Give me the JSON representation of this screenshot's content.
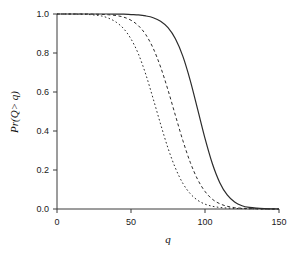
{
  "chart_data": {
    "type": "line",
    "title": "",
    "subtitle": "",
    "xlabel": "q",
    "ylabel": "Pr(Q> q)",
    "xlim": [
      0,
      150
    ],
    "ylim": [
      0.0,
      1.0
    ],
    "grid": false,
    "legend": "none",
    "xticks": [
      0,
      50,
      100,
      150
    ],
    "xtick_labels": [
      "0",
      "50",
      "100",
      "150"
    ],
    "yticks": [
      0.0,
      0.2,
      0.4,
      0.6,
      0.8,
      1.0
    ],
    "ytick_labels": [
      "0.0",
      "0.2",
      "0.4",
      "0.6",
      "0.8",
      "1.0"
    ],
    "background_color": "#ffffff",
    "axis_color": "#3b3b3b",
    "curve_color": "#2b2b2b",
    "series": [
      {
        "name": "curve-1-dotted",
        "style": "dotted",
        "dasharray": "1.6 2.4",
        "linewidth": 1.0,
        "midpoint_q": 65,
        "x": [
          0,
          5,
          10,
          15,
          20,
          25,
          30,
          35,
          40,
          45,
          50,
          55,
          60,
          65,
          70,
          75,
          80,
          85,
          90,
          95,
          100,
          105,
          110,
          115,
          120,
          125,
          130,
          135,
          140,
          145,
          150
        ],
        "y": [
          1.0,
          1.0,
          1.0,
          0.999,
          0.998,
          0.995,
          0.99,
          0.978,
          0.958,
          0.925,
          0.872,
          0.795,
          0.69,
          0.565,
          0.435,
          0.312,
          0.21,
          0.132,
          0.079,
          0.045,
          0.025,
          0.014,
          0.008,
          0.005,
          0.003,
          0.002,
          0.001,
          0.001,
          0.0,
          0.0,
          0.0
        ]
      },
      {
        "name": "curve-2-dashed",
        "style": "dashed",
        "dasharray": "3 2.6",
        "linewidth": 1.0,
        "midpoint_q": 82,
        "x": [
          0,
          5,
          10,
          15,
          20,
          25,
          30,
          35,
          40,
          45,
          50,
          55,
          60,
          65,
          70,
          75,
          80,
          85,
          90,
          95,
          100,
          105,
          110,
          115,
          120,
          125,
          130,
          135,
          140,
          145,
          150
        ],
        "y": [
          1.0,
          1.0,
          1.0,
          1.0,
          1.0,
          0.999,
          0.998,
          0.996,
          0.992,
          0.984,
          0.968,
          0.94,
          0.894,
          0.824,
          0.728,
          0.61,
          0.48,
          0.352,
          0.24,
          0.152,
          0.09,
          0.05,
          0.027,
          0.014,
          0.007,
          0.004,
          0.002,
          0.001,
          0.0,
          0.0,
          0.0
        ]
      },
      {
        "name": "curve-3-solid",
        "style": "solid",
        "dasharray": "none",
        "linewidth": 1.2,
        "midpoint_q": 97,
        "x": [
          0,
          5,
          10,
          15,
          20,
          25,
          30,
          35,
          40,
          45,
          50,
          55,
          60,
          65,
          70,
          75,
          80,
          85,
          90,
          95,
          100,
          105,
          110,
          115,
          120,
          125,
          130,
          135,
          140,
          145,
          150
        ],
        "y": [
          1.0,
          1.0,
          1.0,
          1.0,
          1.0,
          1.0,
          1.0,
          1.0,
          0.999,
          0.999,
          0.997,
          0.995,
          0.99,
          0.981,
          0.963,
          0.93,
          0.873,
          0.784,
          0.66,
          0.512,
          0.362,
          0.232,
          0.135,
          0.072,
          0.036,
          0.017,
          0.008,
          0.004,
          0.002,
          0.001,
          0.0
        ]
      }
    ]
  },
  "axes": {
    "y_title": "Pr(Q> q)",
    "x_title": "q"
  }
}
